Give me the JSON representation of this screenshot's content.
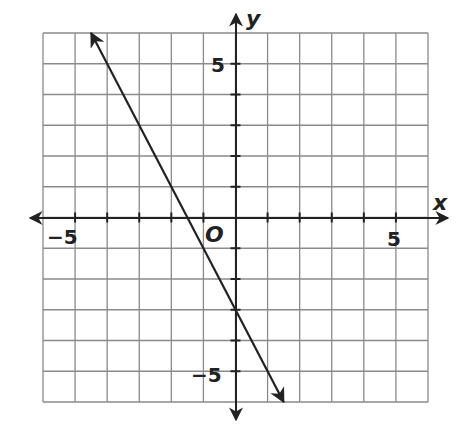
{
  "chart_data": {
    "type": "line",
    "title": "",
    "xlabel": "x",
    "ylabel": "y",
    "origin_label": "O",
    "xlim": [
      -6,
      6
    ],
    "ylim": [
      -6,
      6
    ],
    "grid": true,
    "x_tick_labels": [
      {
        "value": -5,
        "label": "−5"
      },
      {
        "value": 5,
        "label": "5"
      }
    ],
    "y_tick_labels": [
      {
        "value": 5,
        "label": "5"
      },
      {
        "value": -5,
        "label": "−5"
      }
    ],
    "series": [
      {
        "name": "line",
        "equation": "y = -2x - 3",
        "slope": -2,
        "y_intercept": -3,
        "x_intercept": -1.5,
        "x": [
          -4.5,
          1.5
        ],
        "y": [
          6,
          -6
        ],
        "arrows_both_ends": true,
        "color": "#222222"
      }
    ]
  },
  "labels": {
    "x_axis": "x",
    "y_axis": "y",
    "origin": "O",
    "x_neg5": "−5",
    "x_pos5": "5",
    "y_pos5": "5",
    "y_neg5": "−5"
  }
}
